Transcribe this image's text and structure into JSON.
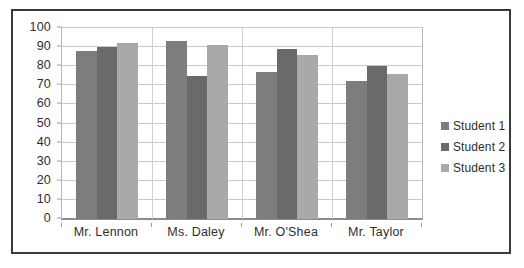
{
  "chart_data": {
    "type": "bar",
    "title": "",
    "subtitle": "",
    "xlabel": "",
    "ylabel": "",
    "categories": [
      "Mr. Lennon",
      "Ms. Daley",
      "Mr. O'Shea",
      "Mr. Taylor"
    ],
    "series": [
      {
        "name": "Student 1",
        "values": [
          88,
          93,
          77,
          72
        ],
        "color": "#7d7d7d"
      },
      {
        "name": "Student 2",
        "values": [
          90,
          75,
          89,
          80
        ],
        "color": "#6a6a6a"
      },
      {
        "name": "Student 3",
        "values": [
          92,
          91,
          86,
          76
        ],
        "color": "#a9a9a9"
      }
    ],
    "ylim": [
      0,
      100
    ],
    "y_ticks": [
      0,
      10,
      20,
      30,
      40,
      50,
      60,
      70,
      80,
      90,
      100
    ],
    "y_tick_labels": [
      "0",
      "10",
      "20",
      "30",
      "40",
      "50",
      "60",
      "70",
      "80",
      "90",
      "100"
    ],
    "grid": true,
    "grid_axis": "y",
    "legend_position": "right",
    "legend": [
      "Student 1",
      "Student 2",
      "Student 3"
    ],
    "bar_gap_within_group": 0,
    "frame_border_color": "#3a3a3a",
    "gridline_color": "#c9c9c9",
    "axis_color": "#8c8c8c",
    "text_color": "#2e2e2e",
    "background_color": "#ffffff"
  }
}
